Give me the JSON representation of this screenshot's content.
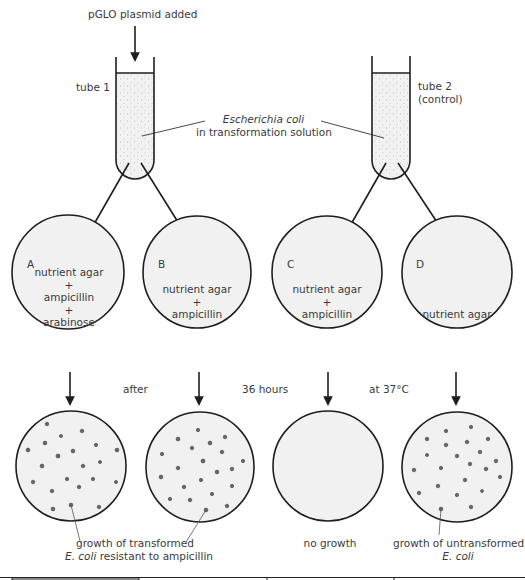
{
  "top_label": "pGLO plasmid added",
  "tubes": [
    {
      "id": "tube1",
      "label": "tube 1"
    },
    {
      "id": "tube2",
      "label_line1": "tube 2",
      "label_line2": "(control)"
    }
  ],
  "solution_label": {
    "line1": "Escherichia coli",
    "line2": "in transformation solution"
  },
  "plates": [
    {
      "letter": "A",
      "contents": [
        "nutrient agar",
        "+",
        "ampicillin",
        "+",
        "arabinose"
      ],
      "result": "colonies"
    },
    {
      "letter": "B",
      "contents": [
        "nutrient agar",
        "+",
        "ampicillin"
      ],
      "result": "colonies"
    },
    {
      "letter": "C",
      "contents": [
        "nutrient agar",
        "+",
        "ampicillin"
      ],
      "result": "none"
    },
    {
      "letter": "D",
      "contents": [
        "nutrient agar"
      ],
      "result": "colonies"
    }
  ],
  "incubation": {
    "part1": "after",
    "part2": "36 hours",
    "part3": "at 37°C"
  },
  "results": {
    "transformed_line1": "growth of transformed",
    "transformed_line2_italic": "E. coli",
    "transformed_line2_rest": " resistant to ampicillin",
    "no_growth": "no growth",
    "untransformed_line1": "growth of untransformed",
    "untransformed_line2_italic": "E. coli"
  },
  "colors": {
    "line": "#1e1e1e",
    "plate_fill": "#f1f1f1",
    "liquid_fill": "#efefef",
    "colony": "#555555",
    "text": "#3a3a3a"
  }
}
